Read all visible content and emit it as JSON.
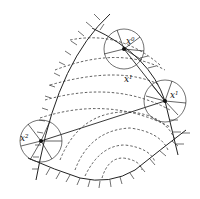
{
  "diagram": {
    "type": "feasible-direction optimization diagram",
    "colors": {
      "line": "#222222",
      "dashed": "#333333",
      "background": "#ffffff"
    },
    "points": [
      {
        "id": "x0",
        "base": "x",
        "sup": "0",
        "cx": 124,
        "cy": 49
      },
      {
        "id": "x1",
        "base": "x",
        "sup": "1",
        "cx": 165,
        "cy": 101
      },
      {
        "id": "x2",
        "base": "x",
        "sup": "2",
        "cx": 41,
        "cy": 141
      },
      {
        "id": "xprime",
        "base": "x",
        "sup": "1",
        "cx": 128,
        "cy": 79
      }
    ],
    "labels": {
      "x0": {
        "base": "x",
        "sup": "0"
      },
      "x1": {
        "base": "x",
        "sup": "1"
      },
      "x2": {
        "base": "x",
        "sup": "2"
      },
      "xmid": {
        "base": "x",
        "sup": "1"
      }
    }
  }
}
